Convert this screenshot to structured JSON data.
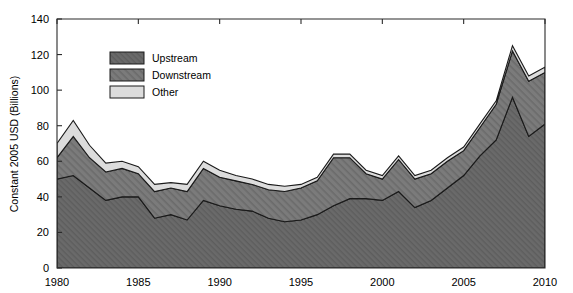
{
  "chart_data": {
    "type": "area",
    "stacked": true,
    "title": "",
    "subtitle": "",
    "xlabel": "",
    "ylabel": "Constant 2005 USD (Billions)",
    "xlim": [
      1980,
      2010
    ],
    "ylim": [
      0,
      140
    ],
    "xticks": [
      1980,
      1985,
      1990,
      1995,
      2000,
      2005,
      2010
    ],
    "xticklabels": [
      "1980",
      "1985",
      "1990",
      "1995",
      "2000",
      "2005",
      "2010"
    ],
    "yticks": [
      0,
      20,
      40,
      60,
      80,
      100,
      120,
      140
    ],
    "yticklabels": [
      "0",
      "20",
      "40",
      "60",
      "80",
      "100",
      "120",
      "140"
    ],
    "grid": false,
    "legend_position": "upper-left-inside",
    "x": [
      1980,
      1981,
      1982,
      1983,
      1984,
      1985,
      1986,
      1987,
      1988,
      1989,
      1990,
      1991,
      1992,
      1993,
      1994,
      1995,
      1996,
      1997,
      1998,
      1999,
      2000,
      2001,
      2002,
      2003,
      2004,
      2005,
      2006,
      2007,
      2008,
      2009,
      2010
    ],
    "series": [
      {
        "name": "Upstream",
        "color": "#6e6e6e",
        "pattern": "solid-dark-gray",
        "values": [
          50,
          52,
          45,
          38,
          40,
          40,
          28,
          30,
          27,
          38,
          35,
          33,
          32,
          28,
          26,
          27,
          30,
          35,
          39,
          39,
          38,
          43,
          34,
          38,
          45,
          52,
          63,
          72,
          96,
          74,
          81
        ]
      },
      {
        "name": "Downstream",
        "color": "#787878",
        "pattern": "hatched-medium-gray",
        "values": [
          12,
          22,
          17,
          16,
          16,
          13,
          15,
          15,
          16,
          18,
          16,
          16,
          15,
          16,
          17,
          18,
          19,
          27,
          23,
          14,
          12,
          18,
          16,
          15,
          15,
          14,
          16,
          20,
          26,
          31,
          29
        ]
      },
      {
        "name": "Other",
        "color": "#dcdcdc",
        "pattern": "light-gray",
        "values": [
          8,
          9,
          7,
          5,
          4,
          4,
          4,
          3,
          4,
          4,
          4,
          3,
          3,
          3,
          3,
          2,
          2,
          2,
          2,
          2,
          2,
          2,
          2,
          2,
          2,
          2,
          2,
          2,
          3,
          3,
          3
        ]
      }
    ],
    "totals": [
      70,
      83,
      69,
      59,
      60,
      57,
      47,
      48,
      47,
      60,
      55,
      52,
      50,
      47,
      46,
      47,
      51,
      64,
      64,
      55,
      52,
      63,
      52,
      55,
      62,
      68,
      81,
      94,
      125,
      108,
      113
    ]
  },
  "legend": {
    "items": [
      {
        "label": "Upstream",
        "swatch": "dark-gray-solid"
      },
      {
        "label": "Downstream",
        "swatch": "medium-gray-hatched"
      },
      {
        "label": "Other",
        "swatch": "light-gray-plain"
      }
    ]
  },
  "colors": {
    "upstream": "#6e6e6e",
    "downstream": "#787878",
    "other": "#dcdcdc",
    "outline": "#1a1a1a",
    "axis": "#2b2b2b",
    "background": "#ffffff"
  }
}
